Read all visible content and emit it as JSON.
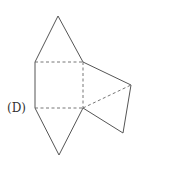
{
  "figure": {
    "label": "(D)",
    "colors": {
      "line": "#555555",
      "background": "#ffffff"
    },
    "vertices": {
      "top_apex": [
        58,
        16
      ],
      "square_top_left": [
        35,
        62
      ],
      "square_top_right": [
        83,
        62
      ],
      "square_bottom_left": [
        35,
        108
      ],
      "square_bottom_right": [
        83,
        108
      ],
      "right_vertex": [
        131,
        85
      ],
      "bottom_right_vertex": [
        123,
        133
      ],
      "bottom_apex": [
        59,
        155
      ]
    },
    "solid_edges": [
      [
        "square_top_left",
        "top_apex"
      ],
      [
        "top_apex",
        "square_top_right"
      ],
      [
        "square_top_left",
        "square_bottom_left"
      ],
      [
        "square_bottom_left",
        "bottom_apex"
      ],
      [
        "bottom_apex",
        "square_bottom_right"
      ],
      [
        "square_top_right",
        "right_vertex"
      ],
      [
        "right_vertex",
        "bottom_right_vertex"
      ],
      [
        "bottom_right_vertex",
        "square_bottom_right"
      ]
    ],
    "dashed_edges": [
      [
        "square_top_left",
        "square_top_right"
      ],
      [
        "square_bottom_left",
        "square_bottom_right"
      ],
      [
        "square_top_right",
        "square_bottom_right"
      ],
      [
        "square_bottom_right",
        "right_vertex"
      ]
    ]
  }
}
